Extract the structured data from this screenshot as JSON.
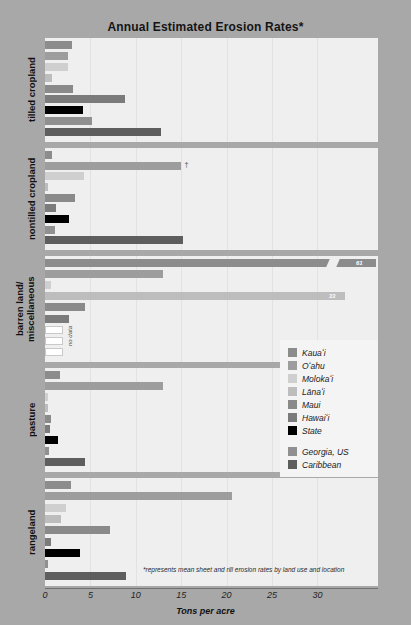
{
  "title": "Annual Estimated Erosion Rates*",
  "footnote": "*represents mean sheet and rill erosion rates by land use and location",
  "axis": {
    "xlabel": "Tons per acre",
    "ticks": [
      "0",
      "5",
      "10",
      "15",
      "20",
      "25",
      "30"
    ]
  },
  "legend": {
    "entries": [
      {
        "label": "Kauaʻi",
        "color": "#8c8c8c"
      },
      {
        "label": "Oʻahu",
        "color": "#9d9d9d"
      },
      {
        "label": "Molokaʻi",
        "color": "#cfcfcf"
      },
      {
        "label": "Lānaʻi",
        "color": "#bdbdbd"
      },
      {
        "label": "Maui",
        "color": "#8a8a8a"
      },
      {
        "label": "Hawaiʻi",
        "color": "#7b7b7b"
      },
      {
        "label": "State",
        "color": "#000000"
      }
    ],
    "extra": [
      {
        "label": "Georgia, US",
        "color": "#909090"
      },
      {
        "label": "Caribbean",
        "color": "#5e5e5e"
      }
    ]
  },
  "labels": {
    "no_data": "no data",
    "dagger": "†"
  },
  "chart_data": {
    "type": "bar",
    "title": "Annual Estimated Erosion Rates*",
    "xlabel": "Tons per acre",
    "ylabel": "",
    "orientation": "horizontal",
    "xlim": [
      0,
      36.5
    ],
    "grid": true,
    "legend_position": "center-right",
    "series": [
      {
        "name": "Kauaʻi",
        "color": "#8c8c8c"
      },
      {
        "name": "Oʻahu",
        "color": "#9d9d9d"
      },
      {
        "name": "Molokaʻi",
        "color": "#cfcfcf"
      },
      {
        "name": "Lānaʻi",
        "color": "#bdbdbd"
      },
      {
        "name": "Maui",
        "color": "#8a8a8a"
      },
      {
        "name": "Hawaiʻi",
        "color": "#7b7b7b"
      },
      {
        "name": "State",
        "color": "#000000"
      },
      {
        "name": "Georgia, US",
        "color": "#909090"
      },
      {
        "name": "Caribbean",
        "color": "#5e5e5e"
      }
    ],
    "groups": [
      {
        "category": "tilled cropland",
        "bars": [
          {
            "series": "Kauaʻi",
            "value": 3.0
          },
          {
            "series": "Oʻahu",
            "value": 2.5
          },
          {
            "series": "Molokaʻi",
            "value": 2.5
          },
          {
            "series": "Lānaʻi",
            "value": 0.8
          },
          {
            "series": "Maui",
            "value": 3.1
          },
          {
            "series": "Hawaiʻi",
            "value": 8.8
          },
          {
            "series": "State",
            "value": 4.2
          },
          {
            "series": "Georgia, US",
            "value": 5.2
          },
          {
            "series": "Caribbean",
            "value": 12.8
          }
        ]
      },
      {
        "category": "nontilled cropland",
        "bars": [
          {
            "series": "Kauaʻi",
            "value": 0.8
          },
          {
            "series": "Oʻahu",
            "value": 15.0,
            "note": "†"
          },
          {
            "series": "Molokaʻi",
            "value": 4.3
          },
          {
            "series": "Lānaʻi",
            "value": 0.3
          },
          {
            "series": "Maui",
            "value": 3.3
          },
          {
            "series": "Hawaiʻi",
            "value": 1.2
          },
          {
            "series": "State",
            "value": 2.6
          },
          {
            "series": "Georgia, US",
            "value": 1.1
          },
          {
            "series": "Caribbean",
            "value": 15.2
          }
        ]
      },
      {
        "category": "barren land/\nmiscellaneous",
        "bars": [
          {
            "series": "Kauaʻi",
            "value": 61,
            "broken": true,
            "label": "61"
          },
          {
            "series": "Oʻahu",
            "value": 13.0
          },
          {
            "series": "Molokaʻi",
            "value": 0.7
          },
          {
            "series": "Lānaʻi",
            "value": 33,
            "label": "33"
          },
          {
            "series": "Maui",
            "value": 4.4
          },
          {
            "series": "Hawaiʻi",
            "value": 2.6
          },
          {
            "series": "State",
            "value": null,
            "no_data": true
          },
          {
            "series": "Georgia, US",
            "value": null,
            "no_data": true
          },
          {
            "series": "Caribbean",
            "value": null,
            "no_data": true
          }
        ]
      },
      {
        "category": "pasture",
        "bars": [
          {
            "series": "Kauaʻi",
            "value": 1.6
          },
          {
            "series": "Oʻahu",
            "value": 13.0
          },
          {
            "series": "Molokaʻi",
            "value": 0.3
          },
          {
            "series": "Lānaʻi",
            "value": 0.1
          },
          {
            "series": "Maui",
            "value": 0.7
          },
          {
            "series": "Hawaiʻi",
            "value": 0.6
          },
          {
            "series": "State",
            "value": 1.4
          },
          {
            "series": "Georgia, US",
            "value": 0.4
          },
          {
            "series": "Caribbean",
            "value": 4.4
          }
        ]
      },
      {
        "category": "rangeland",
        "bars": [
          {
            "series": "Kauaʻi",
            "value": 2.9
          },
          {
            "series": "Oʻahu",
            "value": 20.6
          },
          {
            "series": "Molokaʻi",
            "value": 2.3
          },
          {
            "series": "Lānaʻi",
            "value": 1.8
          },
          {
            "series": "Maui",
            "value": 7.2
          },
          {
            "series": "Hawaiʻi",
            "value": 0.7
          },
          {
            "series": "State",
            "value": 3.9
          },
          {
            "series": "Georgia, US",
            "value": 0.1
          },
          {
            "series": "Caribbean",
            "value": 8.9
          }
        ]
      }
    ]
  }
}
